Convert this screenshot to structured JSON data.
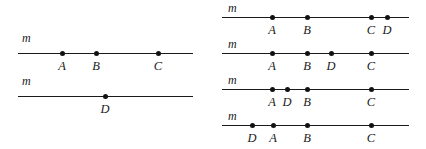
{
  "figure": {
    "background_color": "#ffffff",
    "line_color": "#1a1a1a",
    "dot_color": "#111111",
    "line_label": "m"
  },
  "panels": [
    {
      "name": "left-panel",
      "lines": [
        {
          "name": "left-line-1",
          "label": "m",
          "label_x": 22,
          "label_y": 32,
          "x_start": 18,
          "x_end": 193,
          "y": 53,
          "points": [
            {
              "label": "A",
              "x": 62
            },
            {
              "label": "B",
              "x": 96
            },
            {
              "label": "C",
              "x": 158
            }
          ],
          "label_y_offset": 7
        },
        {
          "name": "left-line-2",
          "label": "m",
          "label_x": 22,
          "label_y": 75,
          "x_start": 18,
          "x_end": 193,
          "y": 96,
          "points": [
            {
              "label": "D",
              "x": 105
            }
          ],
          "label_y_offset": 7
        }
      ]
    },
    {
      "name": "right-panel",
      "lines": [
        {
          "name": "right-line-1",
          "label": "m",
          "label_x": 228,
          "label_y": 2,
          "x_start": 222,
          "x_end": 409,
          "y": 17,
          "points": [
            {
              "label": "A",
              "x": 272
            },
            {
              "label": "B",
              "x": 307
            },
            {
              "label": "C",
              "x": 371
            },
            {
              "label": "D",
              "x": 387
            }
          ],
          "label_y_offset": 7
        },
        {
          "name": "right-line-2",
          "label": "m",
          "label_x": 228,
          "label_y": 38,
          "x_start": 222,
          "x_end": 409,
          "y": 53,
          "points": [
            {
              "label": "A",
              "x": 272
            },
            {
              "label": "B",
              "x": 307
            },
            {
              "label": "D",
              "x": 331
            },
            {
              "label": "C",
              "x": 371
            }
          ],
          "label_y_offset": 7
        },
        {
          "name": "right-line-3",
          "label": "m",
          "label_x": 228,
          "label_y": 74,
          "x_start": 222,
          "x_end": 409,
          "y": 89,
          "points": [
            {
              "label": "A",
              "x": 272
            },
            {
              "label": "D",
              "x": 287
            },
            {
              "label": "B",
              "x": 307
            },
            {
              "label": "C",
              "x": 371
            }
          ],
          "label_y_offset": 7
        },
        {
          "name": "right-line-4",
          "label": "m",
          "label_x": 228,
          "label_y": 110,
          "x_start": 222,
          "x_end": 409,
          "y": 125,
          "points": [
            {
              "label": "D",
              "x": 252
            },
            {
              "label": "A",
              "x": 273
            },
            {
              "label": "B",
              "x": 307
            },
            {
              "label": "C",
              "x": 371
            }
          ],
          "label_y_offset": 7
        }
      ]
    }
  ]
}
